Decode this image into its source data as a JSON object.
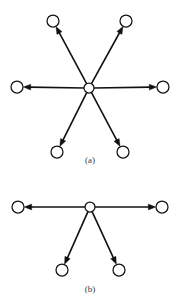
{
  "figure": {
    "background_color": "#ffffff",
    "line_color": "#111111",
    "node_fill_color": "#ffffff",
    "caption_color": "#3a3a3a",
    "width": 180,
    "height": 307,
    "panels": [
      {
        "id": "panel-a",
        "caption": "(a)",
        "caption_x": 90,
        "caption_y": 163,
        "hub": {
          "x": 89,
          "y": 88,
          "r": 5.0
        },
        "leaf_radius": 6.0,
        "leaves": [
          {
            "id": "node-a-top-left",
            "x": 53,
            "y": 21,
            "direction": "up-left"
          },
          {
            "id": "node-a-top-right",
            "x": 126,
            "y": 21,
            "direction": "up-right"
          },
          {
            "id": "node-a-left",
            "x": 17,
            "y": 87,
            "direction": "left"
          },
          {
            "id": "node-a-right",
            "x": 163,
            "y": 87,
            "direction": "right"
          },
          {
            "id": "node-a-bottom-left",
            "x": 57,
            "y": 152,
            "direction": "down-left"
          },
          {
            "id": "node-a-bottom-right",
            "x": 123,
            "y": 152,
            "direction": "down-right"
          }
        ]
      },
      {
        "id": "panel-b",
        "caption": "(b)",
        "caption_x": 90,
        "caption_y": 292,
        "hub": {
          "x": 90,
          "y": 207,
          "r": 5.0
        },
        "leaf_radius": 6.0,
        "leaves": [
          {
            "id": "node-b-left",
            "x": 18,
            "y": 207,
            "direction": "left"
          },
          {
            "id": "node-b-right",
            "x": 162,
            "y": 207,
            "direction": "right"
          },
          {
            "id": "node-b-bottom-left",
            "x": 62,
            "y": 270,
            "direction": "down-left"
          },
          {
            "id": "node-b-bottom-right",
            "x": 119,
            "y": 270,
            "direction": "down-right"
          }
        ]
      }
    ]
  }
}
